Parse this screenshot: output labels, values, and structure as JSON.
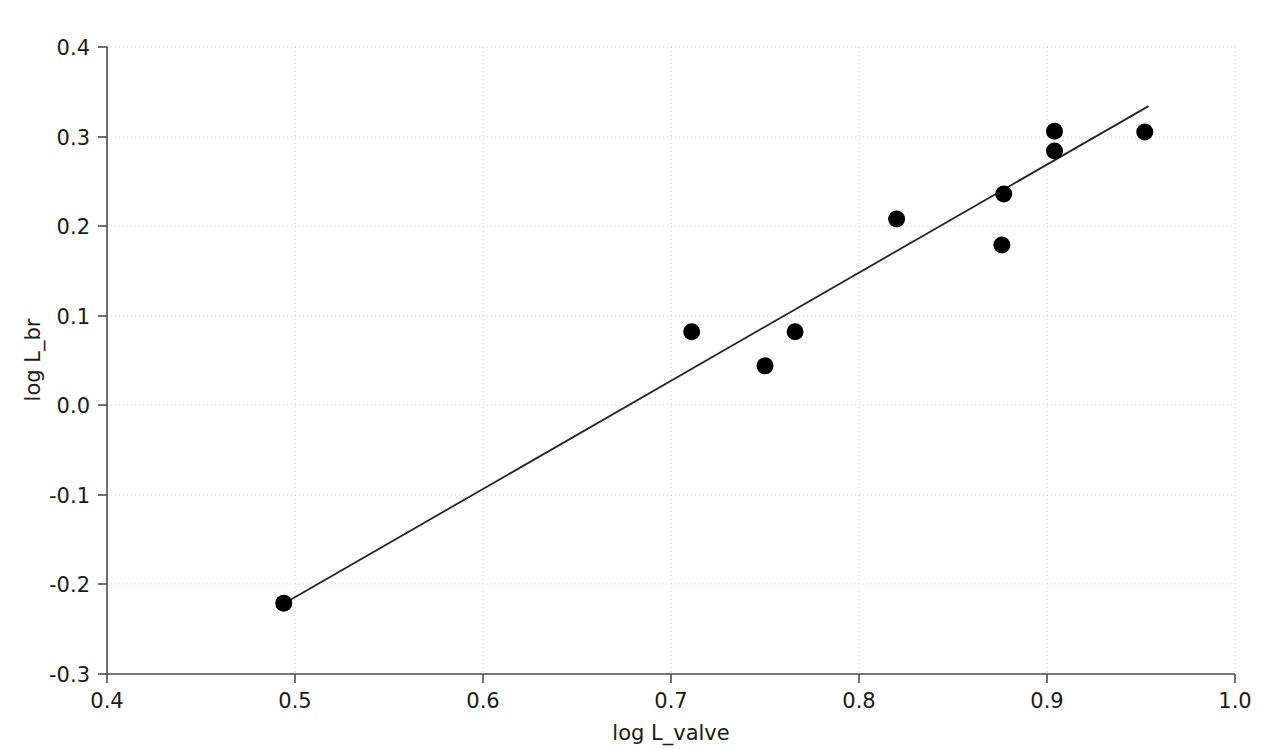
{
  "chart_data": {
    "type": "scatter",
    "title": "",
    "xlabel": "log L_valve",
    "ylabel": "log L_br",
    "xlim": [
      0.4,
      1.0
    ],
    "ylim": [
      -0.3,
      0.4
    ],
    "xticks": [
      "0.4",
      "0.5",
      "0.6",
      "0.7",
      "0.8",
      "0.9",
      "1.0"
    ],
    "xtick_values": [
      0.4,
      0.5,
      0.6,
      0.7,
      0.8,
      0.9,
      1.0
    ],
    "yticks": [
      "0.4",
      "0.3",
      "0.2",
      "0.1",
      "0.0",
      "-0.1",
      "-0.2",
      "-0.3"
    ],
    "ytick_values": [
      0.4,
      0.3,
      0.2,
      0.1,
      0.0,
      -0.1,
      -0.2,
      -0.3
    ],
    "grid": true,
    "legend": "none",
    "marker": "filled-circle",
    "marker_color": "#000000",
    "points": [
      {
        "x": 0.494,
        "y": -0.221
      },
      {
        "x": 0.711,
        "y": 0.082
      },
      {
        "x": 0.75,
        "y": 0.044
      },
      {
        "x": 0.766,
        "y": 0.082
      },
      {
        "x": 0.82,
        "y": 0.208
      },
      {
        "x": 0.876,
        "y": 0.179
      },
      {
        "x": 0.877,
        "y": 0.236
      },
      {
        "x": 0.904,
        "y": 0.284
      },
      {
        "x": 0.904,
        "y": 0.306
      },
      {
        "x": 0.952,
        "y": 0.305
      }
    ],
    "series": [
      {
        "name": "observations",
        "x": [
          0.494,
          0.711,
          0.75,
          0.766,
          0.82,
          0.876,
          0.877,
          0.904,
          0.904,
          0.952
        ],
        "values": [
          -0.221,
          0.082,
          0.044,
          0.082,
          0.208,
          0.179,
          0.236,
          0.284,
          0.306,
          0.305
        ]
      },
      {
        "name": "fit-line",
        "type": "line",
        "x": [
          0.496,
          0.954
        ],
        "values": [
          -0.219,
          0.334
        ]
      }
    ],
    "fit_line": {
      "x_start": 0.496,
      "y_start": -0.219,
      "x_end": 0.954,
      "y_end": 0.334,
      "slope": 1.207,
      "intercept": -0.818,
      "color": "#262626"
    }
  },
  "axes": {
    "x_title": "log L_valve",
    "y_title": "log L_br"
  }
}
